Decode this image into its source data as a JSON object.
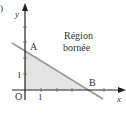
{
  "figure": {
    "region_label_line1": "Région",
    "region_label_line2": "bornée",
    "point_a": "A",
    "point_b": "B",
    "origin": "O",
    "x_axis_label": "x",
    "y_axis_label": "y",
    "x_tick_label": "1",
    "y_tick_label": "1",
    "corner_mark": ")"
  },
  "colors": {
    "axis": "#222222",
    "line": "#999999",
    "region_fill": "#e4e4e4",
    "text": "#333333"
  }
}
